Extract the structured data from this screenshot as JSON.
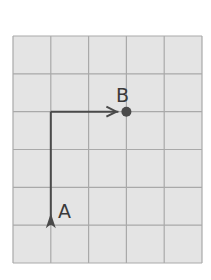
{
  "diagram": {
    "grid": {
      "columns": 5,
      "rows": 6,
      "fill": "#e4e4e4",
      "line_color": "#a9a9a9"
    },
    "path": {
      "color": "#4a4a4a",
      "segments": [
        {
          "from": [
            1,
            1
          ],
          "to": [
            1,
            4
          ],
          "direction": "up"
        },
        {
          "from": [
            1,
            4
          ],
          "to": [
            3,
            4
          ],
          "direction": "right"
        }
      ]
    },
    "points": {
      "A": {
        "label": "A",
        "grid_pos": [
          1,
          1
        ],
        "marker": "arrowhead-up"
      },
      "B": {
        "label": "B",
        "grid_pos": [
          3,
          4
        ],
        "marker": "dot"
      }
    }
  }
}
